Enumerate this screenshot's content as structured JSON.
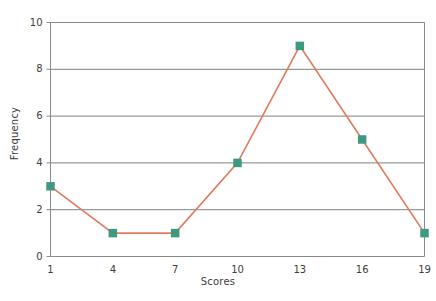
{
  "chart_data": {
    "type": "line",
    "title": "",
    "subtitle": "",
    "xlabel": "Scores",
    "ylabel": "Frequency",
    "x": [
      1,
      4,
      7,
      10,
      13,
      16,
      19
    ],
    "values": [
      3,
      1,
      1,
      4,
      9,
      5,
      1
    ],
    "series": [
      {
        "name": "Frequency",
        "values": [
          3,
          1,
          1,
          4,
          9,
          5,
          1
        ]
      }
    ],
    "xticks": [
      "1",
      "4",
      "7",
      "10",
      "13",
      "16",
      "19"
    ],
    "yticks": [
      "0",
      "2",
      "4",
      "6",
      "8",
      "10"
    ],
    "ytick_values": [
      0,
      2,
      4,
      6,
      8,
      10
    ],
    "xlim": [
      1,
      19
    ],
    "ylim": [
      0,
      10
    ],
    "grid": "horizontal",
    "legend": "none",
    "marker": "square",
    "line_color": "#e07a5f",
    "marker_color": "#3f9980",
    "grid_color": "#808080",
    "axis_color": "#8a8a8a",
    "background": "#ffffff",
    "annotations": []
  }
}
